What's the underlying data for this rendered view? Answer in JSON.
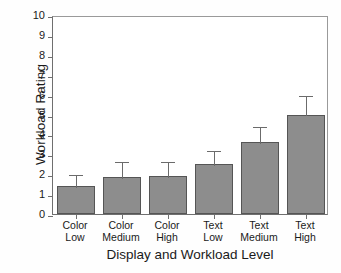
{
  "chart_data": {
    "type": "bar",
    "title": "",
    "xlabel": "Display and Workload Level",
    "ylabel": "Workload Rating",
    "categories": [
      "Color Low",
      "Color Medium",
      "Color High",
      "Text Low",
      "Text Medium",
      "Text High"
    ],
    "category_lines": [
      [
        "Color",
        "Low"
      ],
      [
        "Color",
        "Medium"
      ],
      [
        "Color",
        "High"
      ],
      [
        "Text",
        "Low"
      ],
      [
        "Text",
        "Medium"
      ],
      [
        "Text",
        "High"
      ]
    ],
    "values": [
      1.4,
      1.85,
      1.9,
      2.5,
      3.6,
      5.0
    ],
    "errors": [
      0.65,
      0.85,
      0.8,
      0.75,
      0.85,
      1.05
    ],
    "error_upper": [
      2.05,
      2.7,
      2.7,
      3.25,
      4.45,
      6.05
    ],
    "ylim": [
      0,
      10
    ],
    "yticks": [
      0,
      1,
      2,
      3,
      4,
      5,
      6,
      7,
      8,
      9,
      10
    ],
    "ytick_labels": [
      "0",
      "1",
      "2",
      "3",
      "4",
      "5",
      "6",
      "7",
      "8",
      "9",
      "10"
    ],
    "grid": false,
    "legend": null,
    "bar_color": "#8d8d8d",
    "bar_edge_color": "#555555",
    "error_color": "#6b6b6b",
    "axis_color": "#6f6f6f",
    "background": "#ffffff"
  }
}
